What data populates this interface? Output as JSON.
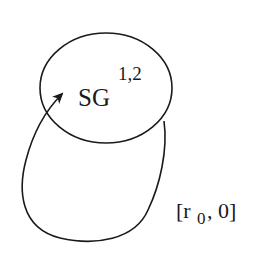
{
  "diagram": {
    "node": {
      "label": "SG",
      "superscript": "1,2"
    },
    "edge": {
      "type": "self-loop",
      "label_open": "[r",
      "label_sub": "0",
      "label_close": ", 0]"
    },
    "colors": {
      "stroke": "#1a1a1a",
      "background": "#ffffff"
    }
  }
}
